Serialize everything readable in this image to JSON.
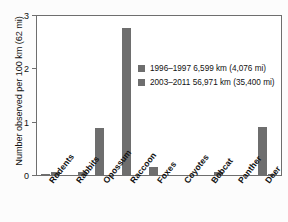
{
  "chart_data": {
    "type": "bar",
    "title": "",
    "xlabel": "",
    "ylabel": "Number observed per 100 km (62 mi)",
    "ylim": [
      0,
      3
    ],
    "yticks": [
      "0",
      "1",
      "2",
      "3"
    ],
    "grid": false,
    "legend_position": "inside-upper-right",
    "categories": [
      "Rodents",
      "Rabbits",
      "Opossum",
      "Raccoon",
      "Foxes",
      "Coyotes",
      "Bobcat",
      "Panther",
      "Deer"
    ],
    "series": [
      {
        "name": "1996–1997 6,599 km (4,076 mi)",
        "color": "#6e6e6e",
        "values": [
          0.03,
          0.0,
          0.9,
          2.78,
          0.17,
          0.0,
          0.0,
          0.0,
          0.92
        ]
      },
      {
        "name": "2003–2011 56,971 km (35,400 mi)",
        "color": "#6e6e6e",
        "values": [
          0.08,
          0.08,
          0.0,
          0.02,
          0.0,
          0.0,
          0.07,
          0.0,
          0.04
        ]
      }
    ]
  },
  "legend": {
    "items": [
      {
        "label": "1996–1997 6,599 km (4,076 mi)"
      },
      {
        "label": "2003–2011 56,971 km (35,400 mi)"
      }
    ]
  },
  "axes": {
    "y_title": "Number observed per 100 km (62 mi)",
    "y_ticks": [
      "3",
      "2",
      "1",
      "0"
    ]
  }
}
